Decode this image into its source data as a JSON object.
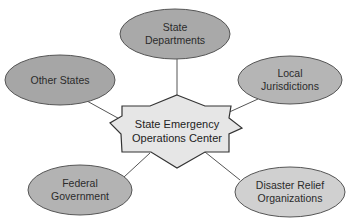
{
  "diagram": {
    "type": "hub-and-spoke",
    "colors": {
      "background": "#ffffff",
      "line": "#555555",
      "center_fill": "#e6e6e6",
      "center_stroke": "#333333",
      "ellipse_stroke": "#555555"
    },
    "center": {
      "id": "seoc",
      "line1": "State Emergency",
      "line2": "Operations Center",
      "shape": "star-burst"
    },
    "nodes": [
      {
        "id": "state-departments",
        "line1": "State",
        "line2": "Departments",
        "cx": 175,
        "cy": 34,
        "rx": 55,
        "ry": 25,
        "fill": "#a9a9a9"
      },
      {
        "id": "other-states",
        "line1": "Other States",
        "line2": "",
        "cx": 60,
        "cy": 80,
        "rx": 55,
        "ry": 25,
        "fill": "#a6a6a6"
      },
      {
        "id": "local-jurisdictions",
        "line1": "Local",
        "line2": "Jurisdictions",
        "cx": 290,
        "cy": 80,
        "rx": 52,
        "ry": 24,
        "fill": "#b5b5b5"
      },
      {
        "id": "federal-government",
        "line1": "Federal",
        "line2": "Government",
        "cx": 80,
        "cy": 190,
        "rx": 52,
        "ry": 25,
        "fill": "#b3b3b3"
      },
      {
        "id": "disaster-relief-organizations",
        "line1": "Disaster Relief",
        "line2": "Organizations",
        "cx": 290,
        "cy": 192,
        "rx": 55,
        "ry": 25,
        "fill": "#d0d0d0"
      }
    ],
    "edges": [
      {
        "from": "seoc",
        "to": "state-departments"
      },
      {
        "from": "seoc",
        "to": "other-states"
      },
      {
        "from": "seoc",
        "to": "local-jurisdictions"
      },
      {
        "from": "seoc",
        "to": "federal-government"
      },
      {
        "from": "seoc",
        "to": "disaster-relief-organizations"
      }
    ]
  }
}
